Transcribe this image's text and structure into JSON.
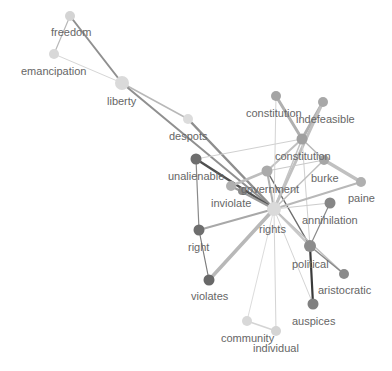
{
  "graph": {
    "type": "word-network",
    "nodes": [
      {
        "id": "freedom",
        "label": "freedom",
        "x": 70,
        "y": 16,
        "r": 5,
        "color": "#d4d4d4",
        "lx": 51,
        "ly": 36
      },
      {
        "id": "emancipation",
        "label": "emancipation",
        "x": 54,
        "y": 54,
        "r": 5,
        "color": "#d8d8d8",
        "lx": 21,
        "ly": 75
      },
      {
        "id": "liberty",
        "label": "liberty",
        "x": 122,
        "y": 83,
        "r": 7,
        "color": "#dadada",
        "lx": 107,
        "ly": 105
      },
      {
        "id": "despots",
        "label": "despots",
        "x": 188,
        "y": 119,
        "r": 5,
        "color": "#dcdcdc",
        "lx": 169,
        "ly": 140
      },
      {
        "id": "unalienable",
        "label": "unalienable",
        "x": 196,
        "y": 159,
        "r": 5.5,
        "color": "#6e6e6e",
        "lx": 168,
        "ly": 180
      },
      {
        "id": "government",
        "label": "government",
        "x": 267,
        "y": 171,
        "r": 5.5,
        "color": "#aaaaaa",
        "lx": 241,
        "ly": 193
      },
      {
        "id": "inviolate",
        "label": "inviolate",
        "x": 231,
        "y": 186,
        "r": 5,
        "color": "#b0b0b0",
        "lx": 211,
        "ly": 207
      },
      {
        "id": "inviolate2",
        "label": "",
        "x": 242,
        "y": 191,
        "r": 4,
        "color": "#8a8a8a",
        "lx": 0,
        "ly": 0
      },
      {
        "id": "rights",
        "label": "rights",
        "x": 274,
        "y": 209,
        "r": 7,
        "color": "#dadada",
        "lx": 259,
        "ly": 233
      },
      {
        "id": "constitution1",
        "label": "constitution",
        "x": 276,
        "y": 96,
        "r": 5,
        "color": "#a4a4a4",
        "lx": 246,
        "ly": 117
      },
      {
        "id": "indefeasible",
        "label": "indefeasible",
        "x": 323,
        "y": 102,
        "r": 5,
        "color": "#a8a8a8",
        "lx": 296,
        "ly": 123
      },
      {
        "id": "constitution2",
        "label": "constitution",
        "x": 302,
        "y": 139,
        "r": 5.5,
        "color": "#a0a0a0",
        "lx": 275,
        "ly": 160
      },
      {
        "id": "burke",
        "label": "burke",
        "x": 324,
        "y": 160,
        "r": 5,
        "color": "#a6a6a6",
        "lx": 311,
        "ly": 182
      },
      {
        "id": "paine",
        "label": "paine",
        "x": 361,
        "y": 182,
        "r": 5,
        "color": "#b0b0b0",
        "lx": 348,
        "ly": 202
      },
      {
        "id": "annihilation",
        "label": "annihilation",
        "x": 330,
        "y": 203,
        "r": 5.5,
        "color": "#868686",
        "lx": 302,
        "ly": 224
      },
      {
        "id": "right",
        "label": "right",
        "x": 199,
        "y": 230,
        "r": 5.5,
        "color": "#6e6e6e",
        "lx": 188,
        "ly": 251
      },
      {
        "id": "political",
        "label": "political",
        "x": 310,
        "y": 246,
        "r": 6,
        "color": "#8c8c8c",
        "lx": 292,
        "ly": 268
      },
      {
        "id": "aristocratic",
        "label": "aristocratic",
        "x": 344,
        "y": 274,
        "r": 5,
        "color": "#8a8a8a",
        "lx": 318,
        "ly": 294
      },
      {
        "id": "violates",
        "label": "violates",
        "x": 209,
        "y": 280,
        "r": 5.5,
        "color": "#686868",
        "lx": 191,
        "ly": 300
      },
      {
        "id": "auspices",
        "label": "auspices",
        "x": 313,
        "y": 304,
        "r": 5.5,
        "color": "#808080",
        "lx": 292,
        "ly": 325
      },
      {
        "id": "community",
        "label": "community",
        "x": 247,
        "y": 321,
        "r": 5,
        "color": "#d8d8d8",
        "lx": 221,
        "ly": 342
      },
      {
        "id": "individual",
        "label": "individual",
        "x": 276,
        "y": 331,
        "r": 5,
        "color": "#d4d4d4",
        "lx": 253,
        "ly": 352
      }
    ],
    "edges": [
      {
        "s": "freedom",
        "t": "emancipation",
        "w": 1.2,
        "c": "#b8b8b8"
      },
      {
        "s": "freedom",
        "t": "liberty",
        "w": 2,
        "c": "#909090"
      },
      {
        "s": "emancipation",
        "t": "liberty",
        "w": 1,
        "c": "#d6d6d6"
      },
      {
        "s": "liberty",
        "t": "despots",
        "w": 1.5,
        "c": "#b8b8b8"
      },
      {
        "s": "liberty",
        "t": "rights",
        "w": 2,
        "c": "#909090"
      },
      {
        "s": "despots",
        "t": "rights",
        "w": 2.5,
        "c": "#8e8e8e"
      },
      {
        "s": "unalienable",
        "t": "rights",
        "w": 2.5,
        "c": "#505050"
      },
      {
        "s": "unalienable",
        "t": "right",
        "w": 1.2,
        "c": "#8a8a8a"
      },
      {
        "s": "unalienable",
        "t": "constitution2",
        "w": 1,
        "c": "#d0d0d0"
      },
      {
        "s": "inviolate",
        "t": "government",
        "w": 2.5,
        "c": "#bdbdbd"
      },
      {
        "s": "inviolate",
        "t": "rights",
        "w": 2,
        "c": "#9a9a9a"
      },
      {
        "s": "government",
        "t": "rights",
        "w": 2,
        "c": "#b0b0b0"
      },
      {
        "s": "government",
        "t": "constitution2",
        "w": 2,
        "c": "#c0c0c0"
      },
      {
        "s": "government",
        "t": "political",
        "w": 1.5,
        "c": "#6e6e6e"
      },
      {
        "s": "constitution1",
        "t": "constitution2",
        "w": 3,
        "c": "#b0b0b0"
      },
      {
        "s": "constitution1",
        "t": "rights",
        "w": 1,
        "c": "#d4d4d4"
      },
      {
        "s": "indefeasible",
        "t": "constitution2",
        "w": 3,
        "c": "#b0b0b0"
      },
      {
        "s": "indefeasible",
        "t": "rights",
        "w": 3,
        "c": "#c0c0c0"
      },
      {
        "s": "constitution2",
        "t": "burke",
        "w": 1.5,
        "c": "#b8b8b8"
      },
      {
        "s": "constitution2",
        "t": "rights",
        "w": 1.5,
        "c": "#c4c4c4"
      },
      {
        "s": "constitution2",
        "t": "political",
        "w": 1,
        "c": "#d0d0d0"
      },
      {
        "s": "burke",
        "t": "paine",
        "w": 3.5,
        "c": "#c0c0c0"
      },
      {
        "s": "burke",
        "t": "rights",
        "w": 1.5,
        "c": "#c0c0c0"
      },
      {
        "s": "government",
        "t": "burke",
        "w": 1,
        "c": "#c8c8c8"
      },
      {
        "s": "paine",
        "t": "rights",
        "w": 2,
        "c": "#b8b8b8"
      },
      {
        "s": "annihilation",
        "t": "rights",
        "w": 1,
        "c": "#cccccc"
      },
      {
        "s": "annihilation",
        "t": "political",
        "w": 1.2,
        "c": "#8a8a8a"
      },
      {
        "s": "rights",
        "t": "right",
        "w": 2,
        "c": "#a8a8a8"
      },
      {
        "s": "rights",
        "t": "violates",
        "w": 3.5,
        "c": "#b8b8b8"
      },
      {
        "s": "rights",
        "t": "political",
        "w": 2,
        "c": "#c8c8c8"
      },
      {
        "s": "rights",
        "t": "aristocratic",
        "w": 1.5,
        "c": "#c0c0c0"
      },
      {
        "s": "rights",
        "t": "auspices",
        "w": 1,
        "c": "#d4d4d4"
      },
      {
        "s": "rights",
        "t": "community",
        "w": 1,
        "c": "#dcdcdc"
      },
      {
        "s": "rights",
        "t": "individual",
        "w": 1,
        "c": "#d4d4d4"
      },
      {
        "s": "right",
        "t": "violates",
        "w": 1.2,
        "c": "#7c7c7c"
      },
      {
        "s": "political",
        "t": "aristocratic",
        "w": 1.5,
        "c": "#8a8a8a"
      },
      {
        "s": "political",
        "t": "auspices",
        "w": 2.2,
        "c": "#3a3a3a"
      },
      {
        "s": "community",
        "t": "individual",
        "w": 1.5,
        "c": "#d4d4d4"
      }
    ]
  }
}
